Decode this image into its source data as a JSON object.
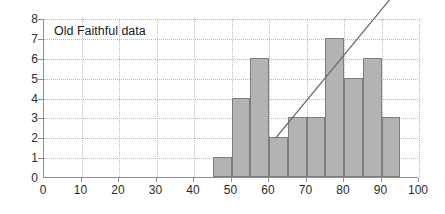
{
  "chart_data": {
    "type": "bar",
    "title": "Old Faithful data",
    "xlabel": "",
    "ylabel": "",
    "xlim": [
      0,
      100
    ],
    "ylim": [
      0,
      8
    ],
    "grid": true,
    "legend": "none",
    "bin_width": 5,
    "bin_starts": [
      45,
      50,
      55,
      60,
      65,
      70,
      75,
      80,
      85,
      90
    ],
    "bin_ends": [
      50,
      55,
      60,
      65,
      70,
      75,
      80,
      85,
      90,
      95
    ],
    "categories": [
      "45-50",
      "50-55",
      "55-60",
      "60-65",
      "65-70",
      "70-75",
      "75-80",
      "80-85",
      "85-90",
      "90-95"
    ],
    "values": [
      1,
      4,
      6,
      2,
      3,
      3,
      7,
      5,
      6,
      3
    ],
    "xticks": [
      0,
      10,
      20,
      30,
      40,
      50,
      60,
      70,
      80,
      90,
      100
    ],
    "yticks": [
      0,
      1,
      2,
      3,
      4,
      5,
      6,
      7,
      8
    ],
    "annotations": [
      {
        "name": "trend-line",
        "type": "line",
        "x": [
          62,
          96.5
        ],
        "y": [
          2,
          9.9
        ]
      }
    ],
    "colors": {
      "bar_fill": "#b3b3b3",
      "bar_stroke": "#7d7d7d",
      "grid": "#b9b9c4",
      "axis": "#8e8e8e",
      "text": "#2b2b2b",
      "line": "#6b6b6b",
      "background": "#ffffff"
    }
  }
}
